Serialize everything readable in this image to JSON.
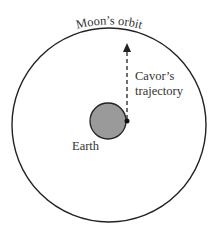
{
  "diagram": {
    "labels": {
      "orbit": "Moon’s orbit",
      "trajectory_line1": "Cavor’s",
      "trajectory_line2": "trajectory",
      "earth": "Earth"
    },
    "colors": {
      "stroke": "#222222",
      "earth_fill": "#9a9a9a",
      "text": "#333333"
    }
  }
}
